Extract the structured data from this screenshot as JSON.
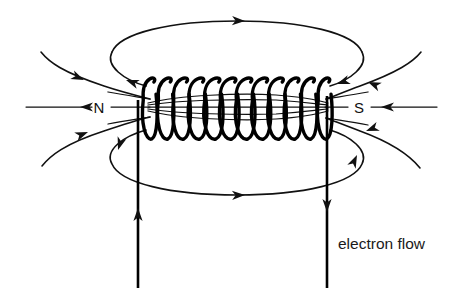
{
  "diagram": {
    "background_color": "#ffffff",
    "stroke_color": "#111111",
    "labels": {
      "north_pole": "N",
      "south_pole": "S",
      "current_caption": "electron flow"
    },
    "coil": {
      "turns": 12,
      "left_x": 150,
      "right_x": 325,
      "top_y": 78,
      "bottom_y": 137
    },
    "leads": {
      "left_direction": "up",
      "right_direction": "down"
    },
    "field_lines": {
      "axis_count": 5,
      "outer_loops": 2,
      "external_curves": 4,
      "straight_axis_lines": 2
    },
    "arrows": {
      "top_loop_direction": "right",
      "bottom_loop_direction": "right",
      "axis_direction": "left"
    }
  }
}
